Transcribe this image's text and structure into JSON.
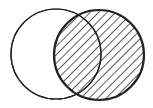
{
  "diagram": {
    "type": "venn",
    "sets": [
      {
        "name": "A",
        "cx": 56,
        "cy": 54,
        "r": 45,
        "shaded": false,
        "stroke_width": 1.2
      },
      {
        "name": "B",
        "cx": 99,
        "cy": 55,
        "r": 45,
        "shaded": true,
        "stroke_width": 2.2
      }
    ],
    "shaded_region": "B",
    "colors": {
      "stroke": "#222222",
      "hatch": "#333333",
      "background": "#ffffff"
    }
  }
}
